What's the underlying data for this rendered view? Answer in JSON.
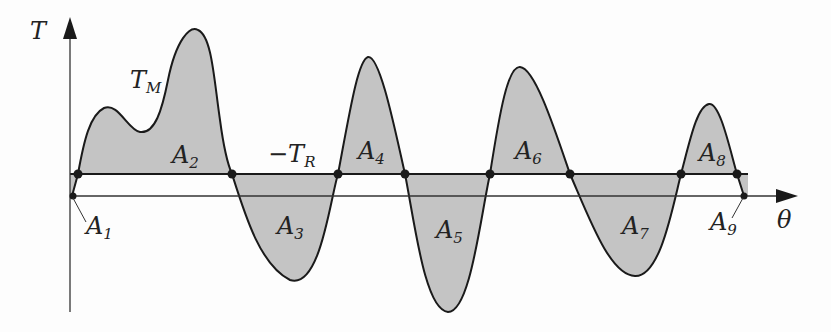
{
  "diagram": {
    "type": "torque-angle curve with shaded areas",
    "axes": {
      "y_label": "T",
      "x_label": "θ"
    },
    "curve_label": {
      "main": "T",
      "sub": "M"
    },
    "reference_line_label": {
      "main": "−T",
      "sub": "R"
    },
    "areas": [
      {
        "main": "A",
        "sub": "1"
      },
      {
        "main": "A",
        "sub": "2"
      },
      {
        "main": "A",
        "sub": "3"
      },
      {
        "main": "A",
        "sub": "4"
      },
      {
        "main": "A",
        "sub": "5"
      },
      {
        "main": "A",
        "sub": "6"
      },
      {
        "main": "A",
        "sub": "7"
      },
      {
        "main": "A",
        "sub": "8"
      },
      {
        "main": "A",
        "sub": "9"
      }
    ],
    "colors": {
      "fill": "#c4c4c4",
      "stroke": "#1a1a1a",
      "background": "#fdfdfd"
    }
  }
}
